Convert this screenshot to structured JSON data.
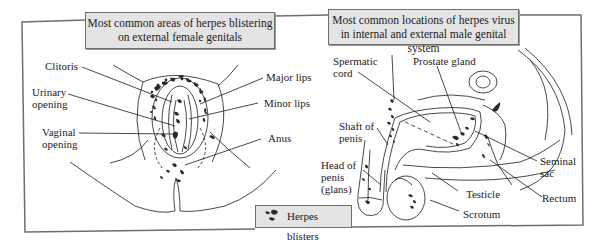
{
  "left_panel": {
    "title_line1": "Most common areas of herpes blistering",
    "title_line2": "on external female genitals",
    "labels": {
      "clitoris": "Clitoris",
      "urinary_1": "Urinary",
      "urinary_2": "opening",
      "vaginal_1": "Vaginal",
      "vaginal_2": "opening",
      "major_lips": "Major lips",
      "minor_lips": "Minor lips",
      "anus": "Anus"
    }
  },
  "right_panel": {
    "title_line1": "Most common locations of herpes virus",
    "title_line2": "in internal and external male genital system",
    "labels": {
      "spermatic_1": "Spermatic",
      "spermatic_2": "cord",
      "prostate": "Prostate gland",
      "shaft_1": "Shaft of",
      "shaft_2": "penis",
      "head_1": "Head of",
      "head_2": "penis",
      "head_3": "(glans)",
      "seminal_1": "Seminal",
      "seminal_2": "sac",
      "testicle": "Testicle",
      "rectum": "Rectum",
      "scrotum": "Scrotum"
    }
  },
  "legend": {
    "label": "Herpes blisters",
    "icon": "herpes-blister-icon"
  },
  "colors": {
    "frame": "#6e6e6e",
    "title_fill": "#e4e4e4",
    "blister": "#2a2a2a",
    "line": "#1c1c1c"
  }
}
